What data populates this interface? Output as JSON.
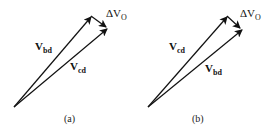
{
  "diagrams": [
    {
      "id": "a",
      "caption": "(a)",
      "upper_vector": {
        "base": "V",
        "sub": "bd"
      },
      "lower_vector": {
        "base": "V",
        "sub": "cd"
      },
      "delta": {
        "base": "ΔV",
        "sub": "O"
      }
    },
    {
      "id": "b",
      "caption": "(b)",
      "upper_vector": {
        "base": "V",
        "sub": "cd"
      },
      "lower_vector": {
        "base": "V",
        "sub": "bd"
      },
      "delta": {
        "base": "ΔV",
        "sub": "O"
      }
    }
  ],
  "colors": {
    "stroke": "#111111",
    "background": "#ffffff"
  }
}
